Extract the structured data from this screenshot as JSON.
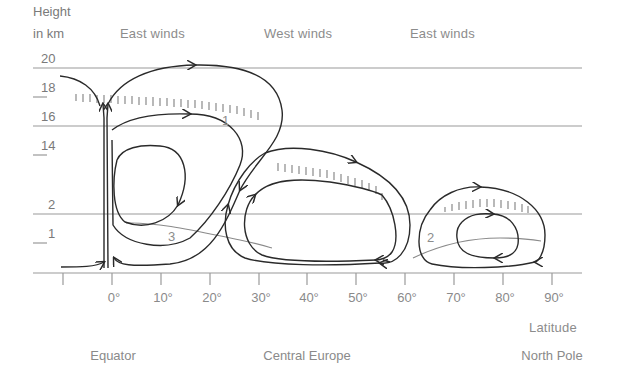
{
  "diagram": {
    "title_axis_y": [
      "Height",
      "in km"
    ],
    "wind_zones": [
      {
        "label": "East winds",
        "x": 120
      },
      {
        "label": "West winds",
        "x": 264
      },
      {
        "label": "East winds",
        "x": 410
      }
    ],
    "y_ticks": [
      {
        "label": "20",
        "y": 68
      },
      {
        "label": "18",
        "y": 97
      },
      {
        "label": "16",
        "y": 126
      },
      {
        "label": "14",
        "y": 155
      },
      {
        "label": "2",
        "y": 214
      },
      {
        "label": "1",
        "y": 243
      }
    ],
    "x_ticks": [
      {
        "label": "",
        "x": 63
      },
      {
        "label": "0°",
        "x": 112
      },
      {
        "label": "10°",
        "x": 161
      },
      {
        "label": "20°",
        "x": 210
      },
      {
        "label": "30°",
        "x": 259
      },
      {
        "label": "40°",
        "x": 307
      },
      {
        "label": "50°",
        "x": 356
      },
      {
        "label": "60°",
        "x": 405
      },
      {
        "label": "70°",
        "x": 454
      },
      {
        "label": "80°",
        "x": 503
      },
      {
        "label": "90°",
        "x": 552
      }
    ],
    "x_axis_label": "Latitude",
    "regions": [
      {
        "label": "Equator",
        "x": 112
      },
      {
        "label": "Central Europe",
        "x": 307
      },
      {
        "label": "North Pole",
        "x": 552
      }
    ],
    "cell_labels": [
      {
        "label": "1",
        "x": 226,
        "y": 125
      },
      {
        "label": "3",
        "x": 172,
        "y": 241
      },
      {
        "label": "2",
        "x": 431,
        "y": 242
      }
    ],
    "colors": {
      "line": "#2a2a2a",
      "grid": "#9a9a9a",
      "tropopause": "#8a8a8a",
      "text": "#8a8a8a"
    }
  }
}
